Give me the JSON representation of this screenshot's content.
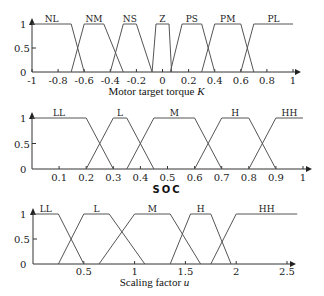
{
  "chart_data": [
    {
      "type": "line",
      "title": "",
      "xlabel": "Motor target torque K",
      "xlabel_text": "Motor target torque ",
      "xlabel_var": "K",
      "ylabel": "",
      "xlim": [
        -1,
        1
      ],
      "ylim": [
        0,
        1
      ],
      "xticks": [
        -1,
        -0.8,
        -0.6,
        -0.4,
        -0.2,
        0,
        0.2,
        0.4,
        0.6,
        0.8,
        1
      ],
      "xtick_labels": [
        "-1",
        "-0.8",
        "-0.6",
        "-0.4",
        "-0.2",
        "0",
        "0.2",
        "0.4",
        "0.6",
        "0.8",
        "1"
      ],
      "yticks": [
        0,
        0.5,
        1
      ],
      "ytick_labels": [
        "0",
        "0.5",
        "1"
      ],
      "grid": false,
      "series": [
        {
          "name": "NL",
          "points": [
            [
              -1,
              1
            ],
            [
              -0.7,
              1
            ],
            [
              -0.6,
              0
            ]
          ]
        },
        {
          "name": "NM",
          "points": [
            [
              -0.7,
              0
            ],
            [
              -0.6,
              1
            ],
            [
              -0.45,
              1
            ],
            [
              -0.3,
              0
            ]
          ]
        },
        {
          "name": "NS",
          "points": [
            [
              -0.4,
              0
            ],
            [
              -0.3,
              1
            ],
            [
              -0.2,
              1
            ],
            [
              -0.08,
              0
            ]
          ]
        },
        {
          "name": "Z",
          "points": [
            [
              -0.08,
              0
            ],
            [
              -0.05,
              1
            ],
            [
              0.05,
              1
            ],
            [
              0.07,
              0
            ]
          ]
        },
        {
          "name": "PS",
          "points": [
            [
              0.06,
              0
            ],
            [
              0.15,
              1
            ],
            [
              0.3,
              1
            ],
            [
              0.4,
              0
            ]
          ]
        },
        {
          "name": "PM",
          "points": [
            [
              0.3,
              0
            ],
            [
              0.4,
              1
            ],
            [
              0.6,
              1
            ],
            [
              0.7,
              0
            ]
          ]
        },
        {
          "name": "PL",
          "points": [
            [
              0.6,
              0
            ],
            [
              0.7,
              1
            ],
            [
              1.0,
              1
            ]
          ]
        }
      ]
    },
    {
      "type": "line",
      "title": "",
      "xlabel": "SOC",
      "ylabel": "",
      "xlim": [
        0,
        1
      ],
      "ylim": [
        0,
        1
      ],
      "xticks": [
        0.1,
        0.2,
        0.3,
        0.4,
        0.5,
        0.6,
        0.7,
        0.8,
        0.9,
        1
      ],
      "xtick_labels": [
        "0.1",
        "0.2",
        "0.3",
        "0.4",
        "0.5",
        "0.6",
        "0.7",
        "0.8",
        "0.9",
        "1"
      ],
      "yticks": [
        0,
        0.5,
        1
      ],
      "ytick_labels": [
        "0",
        "0.5",
        "1"
      ],
      "grid": false,
      "series": [
        {
          "name": "LL",
          "points": [
            [
              0,
              1
            ],
            [
              0.2,
              1
            ],
            [
              0.3,
              0
            ]
          ]
        },
        {
          "name": "L",
          "points": [
            [
              0.2,
              0
            ],
            [
              0.3,
              1
            ],
            [
              0.35,
              1
            ],
            [
              0.45,
              0
            ]
          ]
        },
        {
          "name": "M",
          "points": [
            [
              0.35,
              0
            ],
            [
              0.45,
              1
            ],
            [
              0.6,
              1
            ],
            [
              0.7,
              0
            ]
          ]
        },
        {
          "name": "H",
          "points": [
            [
              0.6,
              0
            ],
            [
              0.7,
              1
            ],
            [
              0.8,
              1
            ],
            [
              0.9,
              0
            ]
          ]
        },
        {
          "name": "HH",
          "points": [
            [
              0.8,
              0
            ],
            [
              0.9,
              1
            ],
            [
              1.0,
              1
            ]
          ]
        }
      ]
    },
    {
      "type": "line",
      "title": "",
      "xlabel": "Scaling factor u",
      "xlabel_text": "Scaling factor ",
      "xlabel_var": "u",
      "ylabel": "",
      "xlim": [
        0,
        2.5
      ],
      "ylim": [
        0,
        1
      ],
      "xticks": [
        0.5,
        1,
        1.5,
        2,
        2.5
      ],
      "xtick_labels": [
        "0.5",
        "1",
        "1.5",
        "2",
        "2.5"
      ],
      "yticks": [
        0,
        0.5,
        1
      ],
      "ytick_labels": [
        "0",
        "0.5",
        "1"
      ],
      "grid": false,
      "series": [
        {
          "name": "LL",
          "points": [
            [
              0,
              1
            ],
            [
              0.25,
              1
            ],
            [
              0.5,
              0
            ]
          ]
        },
        {
          "name": "L",
          "points": [
            [
              0.25,
              0
            ],
            [
              0.5,
              1
            ],
            [
              0.75,
              1
            ],
            [
              1.1,
              0
            ]
          ]
        },
        {
          "name": "M",
          "points": [
            [
              0.65,
              0
            ],
            [
              1.0,
              1
            ],
            [
              1.35,
              1
            ],
            [
              1.65,
              0
            ]
          ]
        },
        {
          "name": "H",
          "points": [
            [
              1.35,
              0
            ],
            [
              1.55,
              1
            ],
            [
              1.75,
              1
            ],
            [
              1.95,
              0
            ]
          ]
        },
        {
          "name": "HH",
          "points": [
            [
              1.75,
              0
            ],
            [
              2.0,
              1
            ],
            [
              2.6,
              1
            ]
          ]
        }
      ]
    }
  ]
}
